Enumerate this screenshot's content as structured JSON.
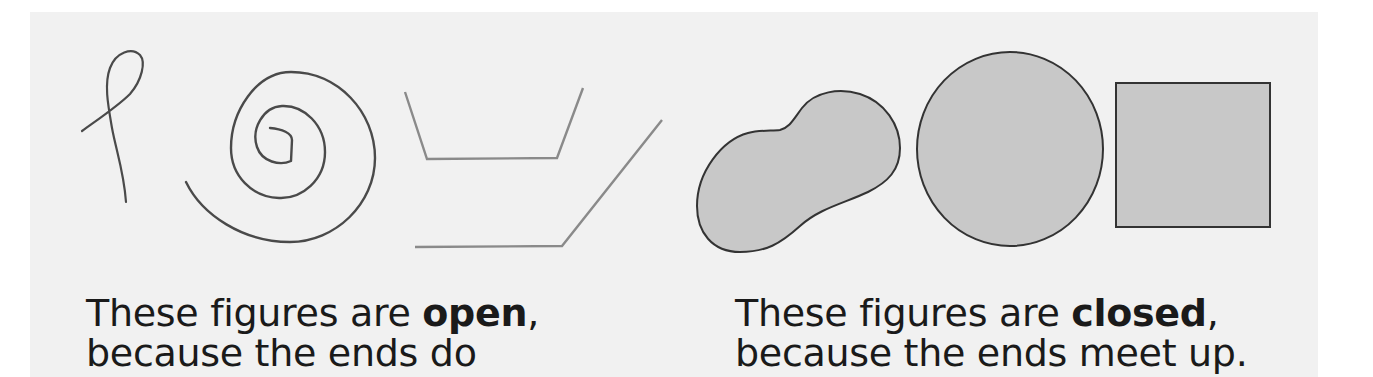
{
  "colors": {
    "page_bg": "#ffffff",
    "panel_bg": "#f1f1f1",
    "open_stroke_dark": "#4a4a4a",
    "open_stroke_light": "#8a8a8a",
    "closed_fill": "#c8c8c8",
    "closed_stroke": "#333333",
    "text": "#1a1a1a"
  },
  "open_figures": {
    "items": [
      {
        "name": "loop-curve"
      },
      {
        "name": "spiral"
      },
      {
        "name": "open-bucket-polyline"
      },
      {
        "name": "open-bent-line"
      }
    ],
    "caption": {
      "line1_prefix": "These figures are ",
      "line1_bold": "open",
      "line1_suffix": ",",
      "line2": "because the ends do"
    }
  },
  "closed_figures": {
    "items": [
      {
        "name": "blob-shape"
      },
      {
        "name": "circle"
      },
      {
        "name": "square"
      }
    ],
    "caption": {
      "line1_prefix": "These figures are ",
      "line1_bold": "closed",
      "line1_suffix": ",",
      "line2": "because the ends meet up."
    }
  }
}
